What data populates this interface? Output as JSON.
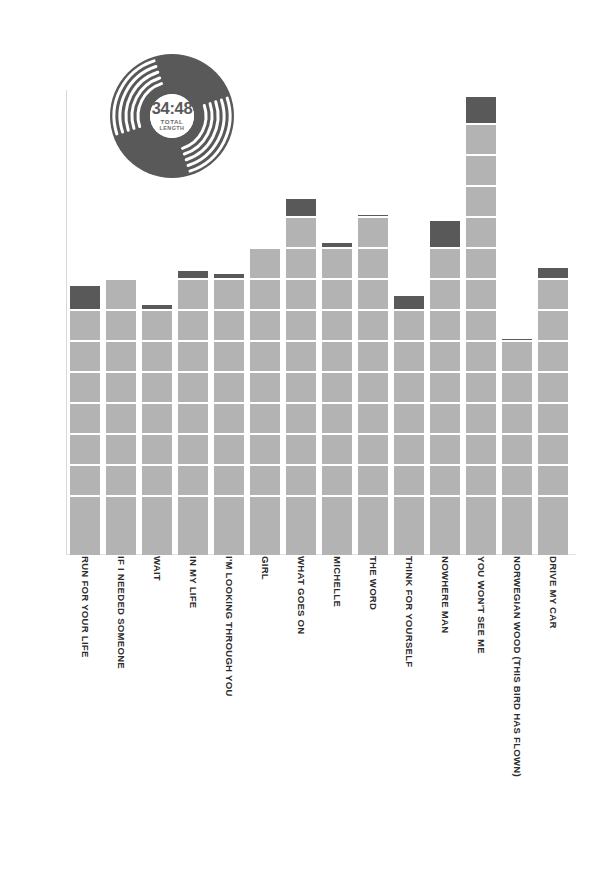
{
  "badge": {
    "icon": "vinyl-record-icon",
    "time": "34:48",
    "caption_line1": "TOTAL",
    "caption_line2": "LENGTH"
  },
  "colors": {
    "bar_light": "#b3b3b3",
    "bar_dark": "#595959",
    "axis": "#d8d8d8",
    "tick_text": "#9a9a9a",
    "label_text": "#2b2b2b",
    "background": "#ffffff"
  },
  "chart_data": {
    "type": "bar",
    "title": "",
    "subtitle": "",
    "xlabel": "",
    "ylabel": "",
    "grid": false,
    "legend": "none",
    "note": "Track lengths shown as m.ss on the y axis; each bar is segmented into 10-second blocks, the topmost (partial) block drawn darker.",
    "ytick_labels": [
      "3.20",
      "3.10",
      "3.00",
      "2.50",
      "2.40",
      "2.30",
      "2.20",
      "2.10",
      "2.00",
      "1.50",
      "1.40",
      "1.30",
      "1.20",
      "1.10",
      "1.00"
    ],
    "ytick_seconds": [
      200,
      190,
      180,
      170,
      160,
      150,
      140,
      130,
      120,
      110,
      100,
      90,
      80,
      70,
      60
    ],
    "ylim_seconds": [
      50,
      200
    ],
    "categories": [
      "RUN FOR YOUR LIFE",
      "IF I NEEDED SOMEONE",
      "WAIT",
      "IN MY LIFE",
      "I'M LOOKING THROUGH YOU",
      "GIRL",
      "WHAT GOES ON",
      "MICHELLE",
      "THE WORD",
      "THINK FOR YOURSELF",
      "NOWHERE MAN",
      "YOU WON'T SEE ME",
      "NORWEGIAN WOOD (THIS BIRD HAS FLOWN)",
      "DRIVE MY CAR"
    ],
    "value_labels": [
      "2:18",
      "2:20",
      "2:12",
      "2:23",
      "2:22",
      "2:30",
      "2:46",
      "2:32",
      "2:41",
      "2:15",
      "2:39",
      "3:19",
      "2:01",
      "2:24"
    ],
    "values": [
      138,
      140,
      132,
      143,
      142,
      150,
      166,
      152,
      161,
      135,
      159,
      199,
      121,
      144
    ]
  }
}
